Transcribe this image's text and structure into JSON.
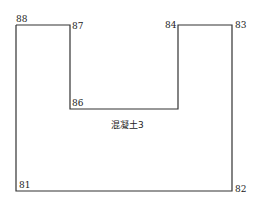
{
  "diagram": {
    "region_label": "混凝土3",
    "stroke_color": "#333333",
    "points": [
      {
        "id": "81",
        "label": "81"
      },
      {
        "id": "82",
        "label": "82"
      },
      {
        "id": "83",
        "label": "83"
      },
      {
        "id": "84",
        "label": "84"
      },
      {
        "id": "86",
        "label": "86"
      },
      {
        "id": "87",
        "label": "87"
      },
      {
        "id": "88",
        "label": "88"
      }
    ]
  }
}
